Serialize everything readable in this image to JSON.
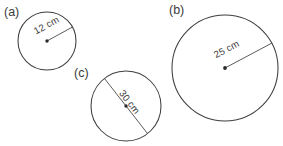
{
  "figure": {
    "background_color": "#ffffff",
    "stroke_color": "#3f3f3f",
    "text_color": "#3a3a3a"
  },
  "parts": [
    {
      "key": "a",
      "label": "(a)",
      "label_x": 4,
      "label_y": 16,
      "circle": {
        "cx": 47,
        "cy": 41,
        "r": 29
      },
      "measure": {
        "kind": "radius",
        "text": "12 cm",
        "value": 12,
        "unit": "cm",
        "x1": 47,
        "y1": 41,
        "x2": 72.5,
        "y2": 27,
        "text_x": 48,
        "text_y": 28,
        "text_rotation": -29
      }
    },
    {
      "key": "b",
      "label": "(b)",
      "label_x": 169,
      "label_y": 14,
      "circle": {
        "cx": 225,
        "cy": 68,
        "r": 53
      },
      "measure": {
        "kind": "radius",
        "text": "25 cm",
        "value": 25,
        "unit": "cm",
        "x1": 225,
        "y1": 68,
        "x2": 272,
        "y2": 43,
        "text_x": 228,
        "text_y": 52,
        "text_rotation": -28
      }
    },
    {
      "key": "c",
      "label": "(c)",
      "label_x": 74,
      "label_y": 77,
      "circle": {
        "cx": 126,
        "cy": 106,
        "r": 35
      },
      "measure": {
        "kind": "diameter",
        "text": "30 cm",
        "value": 30,
        "unit": "cm",
        "x1": 104.5,
        "y1": 78.5,
        "x2": 147.5,
        "y2": 133.5,
        "text_x": 127,
        "text_y": 104,
        "text_rotation": 52
      }
    }
  ]
}
